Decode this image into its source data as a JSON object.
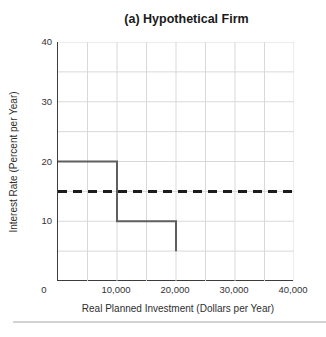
{
  "chart_data": {
    "type": "line",
    "subtype": "step",
    "title": "(a) Hypothetical Firm",
    "xlabel": "Real Planned Investment (Dollars per Year)",
    "ylabel": "Interest Rate (Percent per Year)",
    "xlim": [
      0,
      40000
    ],
    "ylim": [
      0,
      40
    ],
    "grid": {
      "show": true,
      "x_interval": 5000,
      "y_interval": 5,
      "color": "#d9d9d9"
    },
    "x_ticks": [
      {
        "value": 0,
        "label": "0"
      },
      {
        "value": 10000,
        "label": "10,000"
      },
      {
        "value": 20000,
        "label": "20,000"
      },
      {
        "value": 30000,
        "label": "30,000"
      },
      {
        "value": 40000,
        "label": "40,000"
      }
    ],
    "y_ticks": [
      {
        "value": 10,
        "label": "10"
      },
      {
        "value": 20,
        "label": "20"
      },
      {
        "value": 30,
        "label": "30"
      },
      {
        "value": 40,
        "label": "40"
      }
    ],
    "series": [
      {
        "name": "planned-investment-step",
        "style": "solid",
        "color": "#5f5f5f",
        "stroke_width": 2,
        "points": [
          [
            0,
            20
          ],
          [
            10000,
            20
          ],
          [
            10000,
            10
          ],
          [
            20000,
            10
          ],
          [
            20000,
            5
          ]
        ]
      },
      {
        "name": "market-interest-rate",
        "style": "dashed",
        "color": "#1c1c1c",
        "stroke_width": 3,
        "dash": [
          9,
          6
        ],
        "points": [
          [
            0,
            15
          ],
          [
            40000,
            15
          ]
        ]
      }
    ],
    "legend_position": "none"
  },
  "colors": {
    "axis": "#3c3c3c",
    "text": "#2e2e2e",
    "grid": "#d9d9d9",
    "divider": "#d2d2d2",
    "background": "#ffffff"
  }
}
